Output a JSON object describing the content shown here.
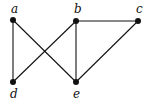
{
  "graph": {
    "nodes": [
      {
        "id": "a",
        "label": "a",
        "x": 13,
        "y": 20,
        "lx": 11,
        "ly": 13
      },
      {
        "id": "b",
        "label": "b",
        "x": 76,
        "y": 21,
        "lx": 74,
        "ly": 13
      },
      {
        "id": "c",
        "label": "c",
        "x": 138,
        "y": 21,
        "lx": 136,
        "ly": 13
      },
      {
        "id": "d",
        "label": "d",
        "x": 13,
        "y": 82,
        "lx": 10,
        "ly": 98
      },
      {
        "id": "e",
        "label": "e",
        "x": 76,
        "y": 82,
        "lx": 73,
        "ly": 98
      }
    ],
    "edges": [
      [
        "a",
        "d"
      ],
      [
        "a",
        "e"
      ],
      [
        "b",
        "d"
      ],
      [
        "b",
        "e"
      ],
      [
        "b",
        "c"
      ],
      [
        "c",
        "e"
      ]
    ]
  }
}
